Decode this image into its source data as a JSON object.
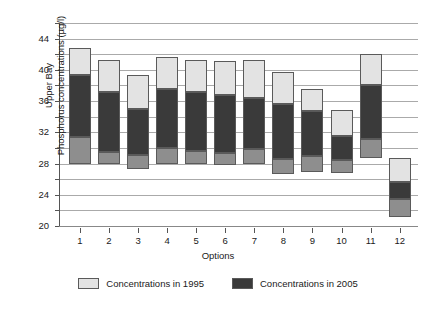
{
  "chart_data": {
    "type": "bar",
    "subtype": "stacked-range-bars",
    "title": "",
    "xlabel": "Options",
    "ylabel": "Upper Bay\nPhosphorus concentrations (µg/l)",
    "ylabel_lines": [
      "Upper Bay",
      "Phosphorus concentrations (µg/l)"
    ],
    "categories": [
      "1",
      "2",
      "3",
      "4",
      "5",
      "6",
      "7",
      "8",
      "9",
      "10",
      "11",
      "12"
    ],
    "ylim": [
      20,
      46
    ],
    "ytick_labels": [
      "20",
      "24",
      "28",
      "32",
      "36",
      "40",
      "44"
    ],
    "ytick_values": [
      20,
      24,
      28,
      32,
      36,
      40,
      44
    ],
    "gridline_values": [
      20,
      22,
      24,
      26,
      28,
      30,
      32,
      34,
      36,
      38,
      40,
      42,
      44,
      46
    ],
    "grid": true,
    "legend_position": "bottom",
    "legend": [
      "Concentrations in 1995",
      "Concentrations in 2005"
    ],
    "series": [
      {
        "name": "lower-segment",
        "color": "#8e8e8e",
        "bounds": [
          [
            28.0,
            31.4
          ],
          [
            28.0,
            29.5
          ],
          [
            27.3,
            29.1
          ],
          [
            28.0,
            30.0
          ],
          [
            27.9,
            29.6
          ],
          [
            27.8,
            29.3
          ],
          [
            28.0,
            29.8
          ],
          [
            26.7,
            28.6
          ],
          [
            26.9,
            29.0
          ],
          [
            26.8,
            28.4
          ],
          [
            28.7,
            31.2
          ],
          [
            21.1,
            23.5
          ]
        ]
      },
      {
        "name": "Concentrations in 2005",
        "color": "#3a3a3a",
        "bounds": [
          [
            31.4,
            39.3
          ],
          [
            29.5,
            37.1
          ],
          [
            29.1,
            35.0
          ],
          [
            30.0,
            37.5
          ],
          [
            29.6,
            37.2
          ],
          [
            29.3,
            36.8
          ],
          [
            29.8,
            36.4
          ],
          [
            28.6,
            35.6
          ],
          [
            29.0,
            34.7
          ],
          [
            28.4,
            31.5
          ],
          [
            31.2,
            38.1
          ],
          [
            23.5,
            25.6
          ]
        ]
      },
      {
        "name": "Concentrations in 1995",
        "color": "#e3e3e3",
        "bounds": [
          [
            39.3,
            42.8
          ],
          [
            37.1,
            41.3
          ],
          [
            35.0,
            39.3
          ],
          [
            37.5,
            41.7
          ],
          [
            37.2,
            41.3
          ],
          [
            36.8,
            41.1
          ],
          [
            36.4,
            41.2
          ],
          [
            35.6,
            39.7
          ],
          [
            34.7,
            37.6
          ],
          [
            31.5,
            34.9
          ],
          [
            38.1,
            42.0
          ],
          [
            25.6,
            28.7
          ]
        ]
      }
    ]
  },
  "axis": {
    "x_title": "Options",
    "y_title_line1": "Upper Bay",
    "y_title_line2": "Phosphorus concentrations (µg/l)"
  },
  "legend": {
    "items": [
      {
        "label": "Concentrations in 1995",
        "color": "#e3e3e3"
      },
      {
        "label": "Concentrations in 2005",
        "color": "#3a3a3a"
      }
    ]
  },
  "colors": {
    "light": "#e3e3e3",
    "dark": "#3a3a3a",
    "mid": "#8e8e8e",
    "grid": "#aaaaaa",
    "stroke": "#5a5a5a",
    "text": "#1a1a1a"
  }
}
